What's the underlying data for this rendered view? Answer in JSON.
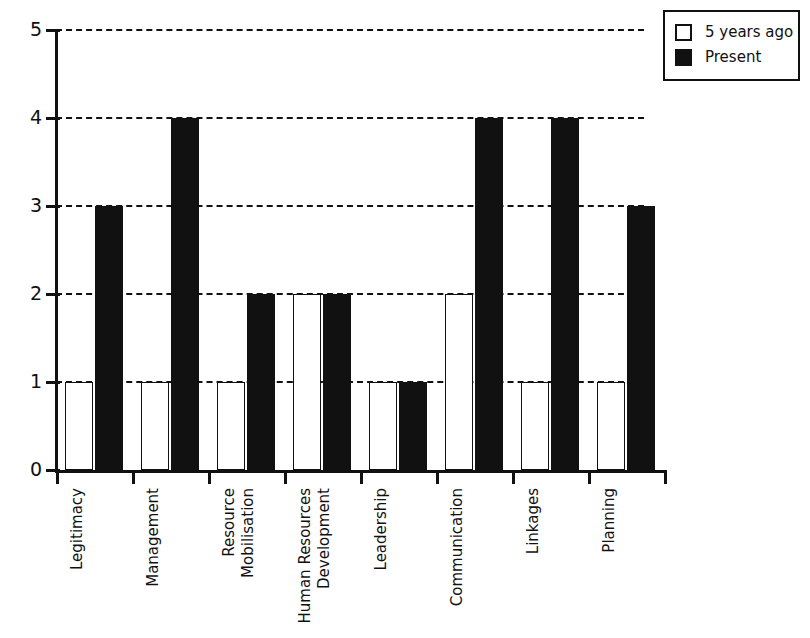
{
  "chart_data": {
    "type": "bar",
    "title": "",
    "subtitle": "",
    "xlabel": "",
    "ylabel": "",
    "ylim": [
      0,
      5
    ],
    "yticks": [
      "0",
      "1",
      "2",
      "3",
      "4",
      "5"
    ],
    "grid": "horizontal-dashed",
    "legend_position": "top-right",
    "categories": [
      "Legitimacy",
      "Management",
      "Resource Mobilisation",
      "Human Resources Development",
      "Leadership",
      "Communication",
      "Linkages",
      "Planning"
    ],
    "category_lines": [
      [
        "Legitimacy"
      ],
      [
        "Management"
      ],
      [
        "Resource",
        "Mobilisation"
      ],
      [
        "Human Resources",
        "Development"
      ],
      [
        "Leadership"
      ],
      [
        "Communication"
      ],
      [
        "Linkages"
      ],
      [
        "Planning"
      ]
    ],
    "series": [
      {
        "name": "5 years ago",
        "key": "past",
        "color": "#ffffff",
        "edge_color": "#111111",
        "values": [
          1,
          1,
          1,
          2,
          1,
          2,
          1,
          1
        ]
      },
      {
        "name": "Present",
        "key": "present",
        "color": "#111111",
        "edge_color": "#111111",
        "values": [
          3,
          4,
          2,
          2,
          1,
          4,
          4,
          3
        ]
      }
    ]
  },
  "legend": {
    "items": [
      {
        "label": "5 years ago",
        "swatch": "past"
      },
      {
        "label": "Present",
        "swatch": "present"
      }
    ]
  },
  "colors": {
    "axis": "#111111",
    "grid": "#111111",
    "background": "#ffffff",
    "past_fill": "#ffffff",
    "present_fill": "#111111"
  }
}
